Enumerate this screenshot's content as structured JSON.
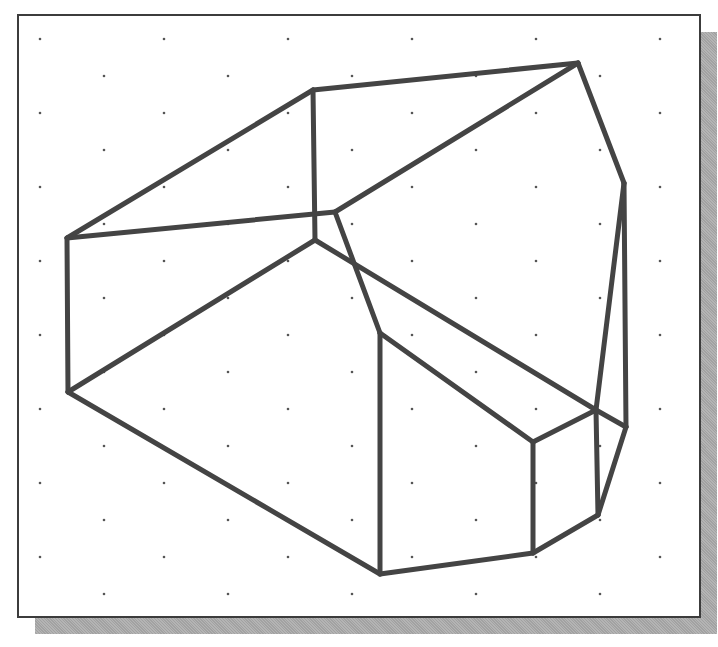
{
  "figure": {
    "line_color": "#444444",
    "line_width": 5,
    "grid_dot_color": "#555555",
    "frame_border_color": "#3c3c3c",
    "shadow_color": "#a9a9a9"
  },
  "grid": {
    "start_y": 39,
    "step_y": 37,
    "rows": 16,
    "even_row_start_x": 40,
    "odd_row_start_x": 104,
    "step_x": 124,
    "max_x": 690
  },
  "vertices": {
    "left_top": [
      67,
      238
    ],
    "left_bottom": [
      68,
      392
    ],
    "top_mid": [
      313,
      90
    ],
    "top_right": [
      578,
      63
    ],
    "right_upper": [
      624,
      183
    ],
    "inner_junction": [
      315,
      213
    ],
    "inner_junction_right": [
      335,
      212
    ],
    "inner_bottom": [
      315,
      240
    ],
    "bend": [
      380,
      333
    ],
    "bottom": [
      380,
      574
    ],
    "box_top_left": [
      533,
      442
    ],
    "box_top_mid": [
      596,
      410
    ],
    "box_top_right": [
      626,
      427
    ],
    "box_bottom_left": [
      533,
      553
    ],
    "box_bottom_right": [
      598,
      515
    ]
  },
  "edges": [
    [
      [
        67,
        238
      ],
      [
        313,
        90
      ]
    ],
    [
      [
        313,
        90
      ],
      [
        578,
        63
      ]
    ],
    [
      [
        578,
        63
      ],
      [
        624,
        183
      ]
    ],
    [
      [
        624,
        183
      ],
      [
        596,
        410
      ]
    ],
    [
      [
        624,
        183
      ],
      [
        626,
        427
      ]
    ],
    [
      [
        313,
        90
      ],
      [
        315,
        240
      ]
    ],
    [
      [
        67,
        238
      ],
      [
        335,
        212
      ]
    ],
    [
      [
        335,
        212
      ],
      [
        578,
        63
      ]
    ],
    [
      [
        335,
        212
      ],
      [
        380,
        333
      ]
    ],
    [
      [
        315,
        240
      ],
      [
        68,
        392
      ]
    ],
    [
      [
        315,
        240
      ],
      [
        596,
        410
      ]
    ],
    [
      [
        67,
        238
      ],
      [
        68,
        392
      ]
    ],
    [
      [
        68,
        392
      ],
      [
        380,
        574
      ]
    ],
    [
      [
        380,
        333
      ],
      [
        380,
        574
      ]
    ],
    [
      [
        380,
        333
      ],
      [
        533,
        442
      ]
    ],
    [
      [
        533,
        442
      ],
      [
        596,
        410
      ]
    ],
    [
      [
        596,
        410
      ],
      [
        626,
        427
      ]
    ],
    [
      [
        533,
        442
      ],
      [
        533,
        553
      ]
    ],
    [
      [
        380,
        574
      ],
      [
        533,
        553
      ]
    ],
    [
      [
        533,
        553
      ],
      [
        598,
        515
      ]
    ],
    [
      [
        596,
        410
      ],
      [
        598,
        515
      ]
    ],
    [
      [
        626,
        427
      ],
      [
        598,
        515
      ]
    ]
  ]
}
